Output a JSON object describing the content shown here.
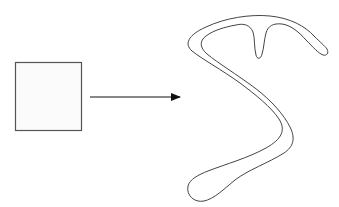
{
  "diagram": {
    "nodes": [
      {
        "id": "source-rectangle",
        "shape": "rectangle",
        "label": ""
      },
      {
        "id": "target-blob",
        "shape": "freeform-curve",
        "label": ""
      }
    ],
    "edges": [
      {
        "from": "source-rectangle",
        "to": "target-blob",
        "type": "arrow",
        "label": ""
      }
    ],
    "colors": {
      "stroke": "#444444",
      "rect_fill": "#fbfbfb",
      "background": "#ffffff"
    }
  }
}
